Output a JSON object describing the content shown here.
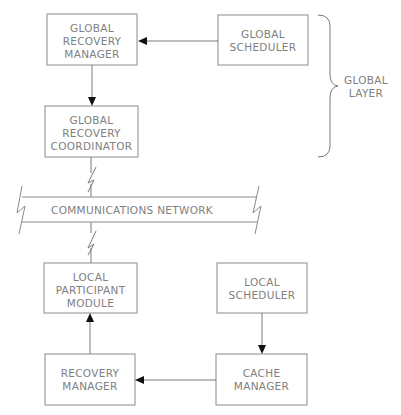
{
  "diagram": {
    "boxes": [
      {
        "id": "global-recovery-manager",
        "x": 47,
        "y": 14,
        "w": 90,
        "h": 51,
        "lines": [
          "GLOBAL",
          "RECOVERY",
          "MANAGER"
        ]
      },
      {
        "id": "global-scheduler",
        "x": 218,
        "y": 15,
        "w": 90,
        "h": 50,
        "lines": [
          "GLOBAL",
          "SCHEDULER"
        ]
      },
      {
        "id": "global-recovery-coordinator",
        "x": 45,
        "y": 106,
        "w": 93,
        "h": 51,
        "lines": [
          "GLOBAL",
          "RECOVERY",
          "COORDINATOR"
        ]
      },
      {
        "id": "local-participant-module",
        "x": 44,
        "y": 263,
        "w": 93,
        "h": 50,
        "lines": [
          "LOCAL",
          "PARTICIPANT",
          "MODULE"
        ]
      },
      {
        "id": "local-scheduler",
        "x": 217,
        "y": 263,
        "w": 90,
        "h": 50,
        "lines": [
          "LOCAL",
          "SCHEDULER"
        ]
      },
      {
        "id": "recovery-manager",
        "x": 45,
        "y": 354,
        "w": 90,
        "h": 51,
        "lines": [
          "RECOVERY",
          "MANAGER"
        ]
      },
      {
        "id": "cache-manager",
        "x": 216,
        "y": 354,
        "w": 91,
        "h": 51,
        "lines": [
          "CACHE",
          "MANAGER"
        ]
      }
    ],
    "network": {
      "label": "COMMUNICATIONS NETWORK"
    },
    "layer": {
      "label_lines": [
        "GLOBAL",
        "LAYER"
      ]
    },
    "arrows": [
      {
        "from": "global-scheduler",
        "to": "global-recovery-manager"
      },
      {
        "from": "global-recovery-manager",
        "to": "global-recovery-coordinator"
      },
      {
        "from": "recovery-manager",
        "to": "local-participant-module"
      },
      {
        "from": "local-scheduler",
        "to": "cache-manager"
      },
      {
        "from": "cache-manager",
        "to": "recovery-manager"
      }
    ],
    "links": [
      {
        "from": "global-recovery-coordinator",
        "to": "communications-network",
        "style": "lightning"
      },
      {
        "from": "communications-network",
        "to": "local-participant-module",
        "style": "lightning"
      }
    ],
    "colors": {
      "stroke": "#8a8a8a",
      "text": "#808080",
      "arrowhead": "#111111"
    }
  }
}
